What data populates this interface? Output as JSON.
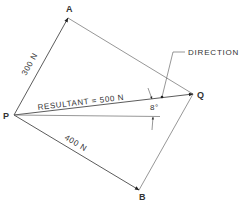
{
  "diagram": {
    "type": "vector-parallelogram",
    "points": {
      "P": {
        "label": "P",
        "x": 14,
        "y": 115
      },
      "A": {
        "label": "A",
        "x": 68,
        "y": 18
      },
      "Q": {
        "label": "Q",
        "x": 193,
        "y": 94
      },
      "B": {
        "label": "B",
        "x": 139,
        "y": 190
      }
    },
    "vectors": {
      "PA": {
        "label": "300 N"
      },
      "PB": {
        "label": "400 N"
      },
      "PQ": {
        "label": "RESULTANT = 500 N"
      }
    },
    "angle": {
      "label": "8°"
    },
    "annotation": {
      "label": "DIRECTION"
    },
    "colors": {
      "line": "#4a4a4a",
      "text": "#333333"
    }
  }
}
